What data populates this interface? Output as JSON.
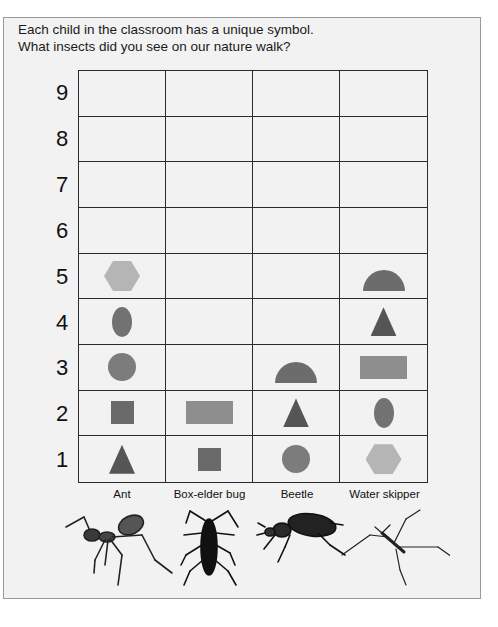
{
  "title": {
    "line1": "Each child in the classroom has a unique symbol.",
    "line2": "What insects did you see on our nature walk?"
  },
  "colors": {
    "hexagon": "#b5b5b5",
    "oval": "#727272",
    "circle": "#7c7c7c",
    "square": "#6a6a6a",
    "rectangle": "#8e8e8e",
    "triangle": "#555555",
    "semicircle": "#6c6c6c"
  },
  "chart_data": {
    "type": "pictograph",
    "title": "What insects did you see on our nature walk?",
    "subtitle": "Each child in the classroom has a unique symbol.",
    "xlabel": "",
    "ylabel": "",
    "ylim": [
      0,
      9
    ],
    "y_ticks": [
      1,
      2,
      3,
      4,
      5,
      6,
      7,
      8,
      9
    ],
    "categories": [
      "Ant",
      "Box-elder bug",
      "Beetle",
      "Water skipper"
    ],
    "values": [
      5,
      2,
      3,
      5
    ],
    "symbols": {
      "Ant": [
        "triangle",
        "square",
        "circle",
        "oval",
        "hexagon"
      ],
      "Box-elder bug": [
        "square",
        "rectangle"
      ],
      "Beetle": [
        "circle",
        "triangle",
        "semicircle"
      ],
      "Water skipper": [
        "hexagon",
        "oval",
        "rectangle",
        "triangle",
        "semicircle"
      ]
    },
    "grid": true
  },
  "y_labels": [
    "9",
    "8",
    "7",
    "6",
    "5",
    "4",
    "3",
    "2",
    "1"
  ],
  "x_labels": [
    "Ant",
    "Box-elder bug",
    "Beetle",
    "Water skipper"
  ],
  "insect_icons": [
    "ant-icon",
    "box-elder-bug-icon",
    "beetle-icon",
    "water-skipper-icon"
  ]
}
